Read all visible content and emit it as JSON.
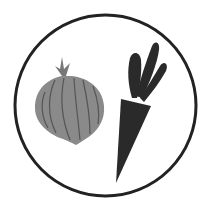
{
  "icon": {
    "label": "Vegetables icon",
    "items": [
      {
        "name": "onion",
        "label": "Onion"
      },
      {
        "name": "carrot",
        "label": "Carrot"
      }
    ]
  },
  "colors": {
    "background": "#ffffff",
    "circle_stroke": "#222222",
    "onion_fill": "#8a8a8a",
    "onion_lines": "#555555",
    "carrot_fill": "#2a2a2a"
  }
}
